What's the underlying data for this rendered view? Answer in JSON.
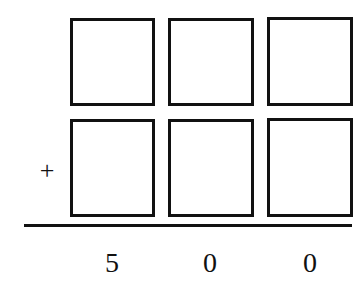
{
  "problem": {
    "operator": "+",
    "addend_rows": [
      {
        "boxes": [
          "",
          "",
          ""
        ]
      },
      {
        "boxes": [
          "",
          "",
          ""
        ]
      }
    ],
    "sum_digits": [
      "5",
      "0",
      "0"
    ]
  }
}
